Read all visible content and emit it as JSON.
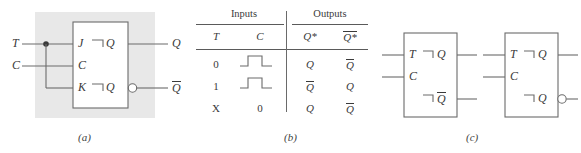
{
  "figure": {
    "panels": [
      {
        "id": "a",
        "caption": "(a)"
      },
      {
        "id": "b",
        "caption": "(b)"
      },
      {
        "id": "c",
        "caption": "(c)"
      }
    ]
  },
  "panel_a": {
    "input_labels": [
      "T",
      "C"
    ],
    "block_input_pins": [
      "J",
      "C",
      "K"
    ],
    "block_output_pins": [
      "Q",
      "Q"
    ],
    "output_labels": [
      "Q",
      "Q"
    ],
    "output_overbar": [
      false,
      true
    ],
    "bubble_on_lower_output": true,
    "junction_dot": true,
    "dynamic_input_marker": "dynamic-indicator"
  },
  "panel_b": {
    "group_headers": [
      "Inputs",
      "Outputs"
    ],
    "columns": [
      "T",
      "C",
      "Q*",
      "Q*"
    ],
    "column_overbar": [
      false,
      false,
      false,
      true
    ],
    "rows": [
      {
        "T": "0",
        "C": "pulse",
        "Qnext": "Q",
        "Qnext_bar": false,
        "QnextN": "Q",
        "QnextN_bar": true
      },
      {
        "T": "1",
        "C": "pulse",
        "Qnext": "Q",
        "Qnext_bar": true,
        "QnextN": "Q",
        "QnextN_bar": false
      },
      {
        "T": "X",
        "C": "0",
        "Qnext": "Q",
        "Qnext_bar": false,
        "QnextN": "Q",
        "QnextN_bar": true
      }
    ]
  },
  "panel_c": {
    "blocks": [
      {
        "name": "t-flip-flop-active-high",
        "input_pins": [
          "T",
          "C"
        ],
        "output_pins": [
          "Q",
          "Q"
        ],
        "output_overbar": [
          false,
          true
        ],
        "bubble_on_lower_output": false
      },
      {
        "name": "t-flip-flop-bubbled",
        "input_pins": [
          "T",
          "C"
        ],
        "output_pins": [
          "Q",
          "Q"
        ],
        "output_overbar": [
          false,
          false
        ],
        "bubble_on_lower_output": true
      }
    ]
  },
  "colors": {
    "line": "#6b6b6b",
    "text": "#3a3a3a",
    "panel_background": "#e8e8e8",
    "page_background": "#ffffff"
  }
}
